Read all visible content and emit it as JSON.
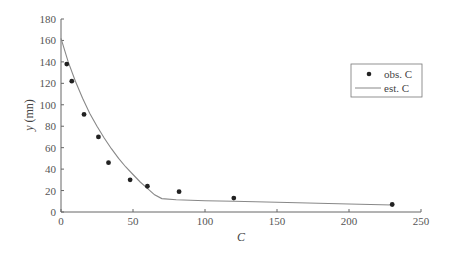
{
  "chart_data": {
    "type": "scatter",
    "title": "",
    "xlabel": "C",
    "ylabel": "y (mn)",
    "xlim": [
      0,
      250
    ],
    "ylim": [
      0,
      180
    ],
    "xticks": [
      0,
      50,
      100,
      150,
      200,
      250
    ],
    "yticks": [
      0,
      20,
      40,
      60,
      80,
      100,
      120,
      140,
      160,
      180
    ],
    "grid": false,
    "legend_position": "right-upper",
    "series": [
      {
        "name": "obs. C",
        "kind": "scatter",
        "color": "#222222",
        "x": [
          4,
          7.5,
          16,
          26,
          33,
          48,
          60,
          82,
          120,
          230
        ],
        "y": [
          138,
          122,
          91,
          70,
          46,
          30,
          24,
          19,
          13,
          7
        ]
      },
      {
        "name": "est. C",
        "kind": "line",
        "color": "#888888",
        "x": [
          0,
          5,
          10,
          15,
          20,
          25,
          30,
          35,
          40,
          45,
          50,
          55,
          60,
          65,
          70,
          80,
          100,
          120,
          150,
          200,
          230
        ],
        "y": [
          162,
          140,
          122,
          106,
          92,
          80,
          69,
          59,
          50,
          42,
          35,
          28,
          22,
          16,
          12.5,
          11.5,
          10.5,
          10,
          9,
          7.5,
          6.5
        ]
      }
    ]
  },
  "legend": {
    "items": [
      {
        "label": "obs. C"
      },
      {
        "label": "est. C"
      }
    ]
  }
}
